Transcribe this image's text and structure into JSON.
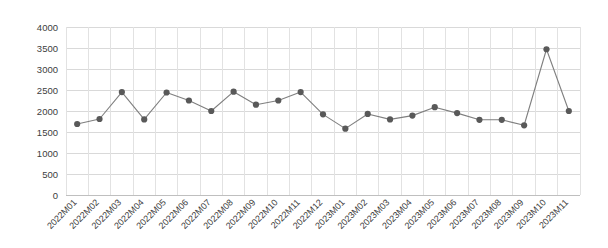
{
  "chart_data": {
    "type": "line",
    "title": "",
    "subtitle": "",
    "xlabel": "",
    "ylabel": "",
    "ylim": [
      0,
      4000
    ],
    "ytick_step": 500,
    "yticks": [
      "0",
      "500",
      "1000",
      "1500",
      "2000",
      "2500",
      "3000",
      "3500",
      "4000"
    ],
    "grid": true,
    "legend": "none",
    "marker": "circle",
    "line_color": "#7f7f7f",
    "marker_color": "#595959",
    "grid_color": "#d9d9d9",
    "categories": [
      "2022M01",
      "2022M02",
      "2022M03",
      "2022M04",
      "2022M05",
      "2022M06",
      "2022M07",
      "2022M08",
      "2022M09",
      "2022M10",
      "2022M11",
      "2022M12",
      "2023M01",
      "2023M02",
      "2023M03",
      "2023M04",
      "2023M05",
      "2023M06",
      "2023M07",
      "2023M08",
      "2023M09",
      "2023M10",
      "2023M11"
    ],
    "values": [
      1690,
      1810,
      2450,
      1800,
      2440,
      2250,
      2000,
      2460,
      2150,
      2250,
      2450,
      1920,
      1580,
      1930,
      1800,
      1890,
      2090,
      1950,
      1790,
      1790,
      1660,
      3470,
      2000
    ],
    "series": [
      {
        "name": "series-1",
        "values": [
          1690,
          1810,
          2450,
          1800,
          2440,
          2250,
          2000,
          2460,
          2150,
          2250,
          2450,
          1920,
          1580,
          1930,
          1800,
          1890,
          2090,
          1950,
          1790,
          1790,
          1660,
          3470,
          2000
        ]
      }
    ]
  },
  "layout": {
    "plot_left": 66,
    "plot_right": 580,
    "plot_top": 27,
    "plot_bottom": 195,
    "xtick_rotation": -45
  }
}
